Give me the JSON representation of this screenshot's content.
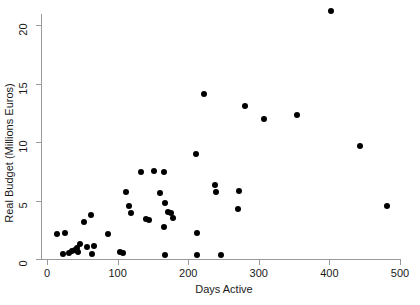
{
  "chart_data": {
    "type": "scatter",
    "title": "",
    "xlabel": "Days Active",
    "ylabel": "Real Budget (Millions Euros)",
    "xlim": [
      -8,
      505
    ],
    "ylim": [
      -0.6,
      21.8
    ],
    "xticks": [
      0,
      100,
      200,
      300,
      400,
      500
    ],
    "yticks": [
      0,
      5,
      10,
      15,
      20
    ],
    "xtick_labels": [
      "0",
      "100",
      "200",
      "300",
      "400",
      "500"
    ],
    "ytick_labels": [
      "0",
      "5",
      "10",
      "15",
      "20"
    ],
    "grid": false,
    "legend": "none",
    "marker_color": "#000000",
    "axis_color": "#9a9a9a",
    "background_color": "#ffffff",
    "n_points": 46,
    "points": [
      {
        "x": 14,
        "y": 2.1
      },
      {
        "x": 22,
        "y": 0.4
      },
      {
        "x": 26,
        "y": 2.2
      },
      {
        "x": 31,
        "y": 0.5
      },
      {
        "x": 36,
        "y": 0.7
      },
      {
        "x": 40,
        "y": 0.8
      },
      {
        "x": 42,
        "y": 0.9
      },
      {
        "x": 44,
        "y": 0.6
      },
      {
        "x": 47,
        "y": 1.3
      },
      {
        "x": 52,
        "y": 3.2
      },
      {
        "x": 56,
        "y": 1.0
      },
      {
        "x": 62,
        "y": 3.8
      },
      {
        "x": 64,
        "y": 0.4
      },
      {
        "x": 66,
        "y": 1.1
      },
      {
        "x": 86,
        "y": 2.1
      },
      {
        "x": 103,
        "y": 0.6
      },
      {
        "x": 108,
        "y": 0.5
      },
      {
        "x": 112,
        "y": 5.7
      },
      {
        "x": 116,
        "y": 4.5
      },
      {
        "x": 119,
        "y": 3.9
      },
      {
        "x": 133,
        "y": 7.4
      },
      {
        "x": 140,
        "y": 3.4
      },
      {
        "x": 145,
        "y": 3.3
      },
      {
        "x": 152,
        "y": 7.5
      },
      {
        "x": 160,
        "y": 5.6
      },
      {
        "x": 166,
        "y": 7.4
      },
      {
        "x": 167,
        "y": 4.8
      },
      {
        "x": 172,
        "y": 4.0
      },
      {
        "x": 175,
        "y": 3.9
      },
      {
        "x": 179,
        "y": 3.5
      },
      {
        "x": 166,
        "y": 2.7
      },
      {
        "x": 167,
        "y": 0.3
      },
      {
        "x": 211,
        "y": 9.0
      },
      {
        "x": 212,
        "y": 2.2
      },
      {
        "x": 212,
        "y": 0.3
      },
      {
        "x": 223,
        "y": 14.1
      },
      {
        "x": 238,
        "y": 6.3
      },
      {
        "x": 240,
        "y": 5.7
      },
      {
        "x": 247,
        "y": 0.3
      },
      {
        "x": 272,
        "y": 5.8
      },
      {
        "x": 271,
        "y": 4.3
      },
      {
        "x": 281,
        "y": 13.1
      },
      {
        "x": 308,
        "y": 12.0
      },
      {
        "x": 354,
        "y": 12.3
      },
      {
        "x": 402,
        "y": 21.2
      },
      {
        "x": 444,
        "y": 9.7
      },
      {
        "x": 481,
        "y": 4.5
      }
    ]
  }
}
